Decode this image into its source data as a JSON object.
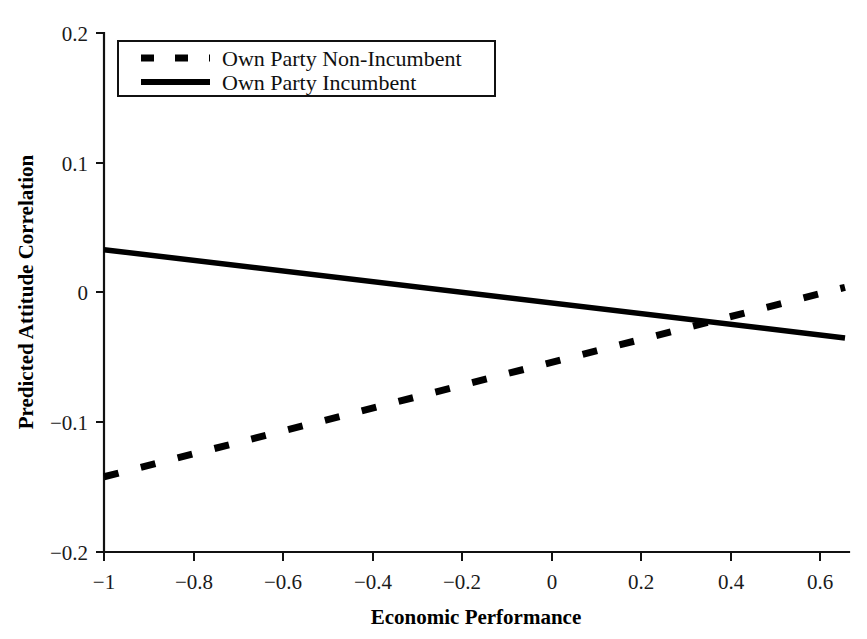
{
  "chart_data": {
    "type": "line",
    "title": "",
    "subtitle": "",
    "xlabel": "Economic Performance",
    "ylabel": "Predicted Attitude Correlation",
    "xlim": [
      -1.0,
      0.66
    ],
    "ylim": [
      -0.2,
      0.2
    ],
    "grid": false,
    "legend_position": "top-left",
    "xticks": [
      -1,
      -0.8,
      -0.6,
      -0.4,
      -0.2,
      0,
      0.2,
      0.4,
      0.6
    ],
    "xtick_labels": [
      "−1",
      "−0.8",
      "−0.6",
      "−0.4",
      "−0.2",
      "0",
      "0.2",
      "0.4",
      "0.6"
    ],
    "yticks": [
      0.2,
      0.1,
      0,
      -0.1,
      -0.2
    ],
    "ytick_labels": [
      "0.2",
      "0.1",
      "0",
      "−0.1",
      "−0.2"
    ],
    "series": [
      {
        "name": "Own Party Non-Incumbent",
        "style": "dashed",
        "color": "#000000",
        "x": [
          -1.0,
          0.66
        ],
        "values": [
          -0.142,
          0.004
        ]
      },
      {
        "name": "Own Party Incumbent",
        "style": "solid",
        "color": "#000000",
        "x": [
          -1.0,
          0.66
        ],
        "values": [
          0.033,
          -0.035
        ]
      }
    ],
    "intersection": {
      "x": 0.34,
      "y": -0.023
    },
    "annotations": []
  },
  "legend": {
    "entries": [
      {
        "label": "Own Party Non-Incumbent",
        "style": "dashed"
      },
      {
        "label": "Own Party Incumbent",
        "style": "solid"
      }
    ]
  },
  "axes": {
    "x_title": "Economic Performance",
    "y_title": "Predicted Attitude Correlation"
  }
}
